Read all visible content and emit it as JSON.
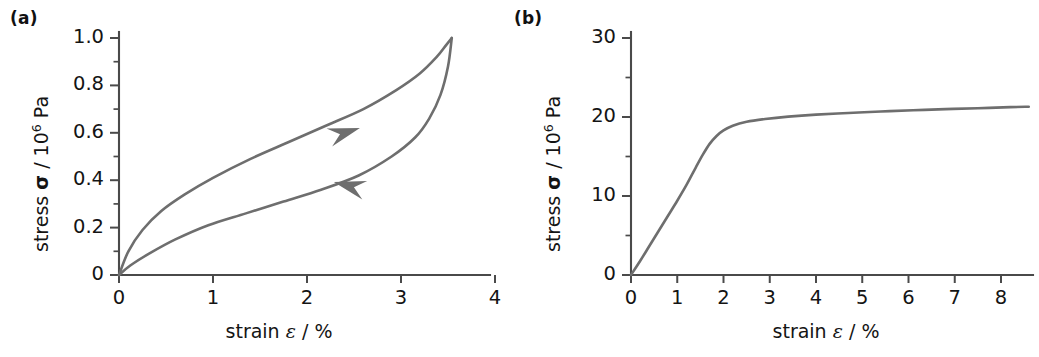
{
  "figure": {
    "background": "#ffffff",
    "curve_color": "#6e6e6e",
    "axis_color": "#4a4a4a",
    "text_color": "#141414"
  },
  "panels": [
    {
      "id": "a",
      "label": "(a)",
      "axis_title_x_pre": "strain ",
      "axis_title_x_sym": "ε",
      "axis_title_x_post": " / %",
      "axis_title_y_pre": "stress ",
      "axis_title_y_sym": "σ",
      "axis_title_y_mid": " / 10",
      "axis_title_y_exp": "6",
      "axis_title_y_post": " Pa",
      "x_ticklabels": [
        "0",
        "1",
        "2",
        "3",
        "4"
      ],
      "y_ticklabels": [
        "0",
        "0.2",
        "0.4",
        "0.6",
        "0.8",
        "1.0"
      ]
    },
    {
      "id": "b",
      "label": "(b)",
      "axis_title_x_pre": "strain ",
      "axis_title_x_sym": "ε",
      "axis_title_x_post": " / %",
      "axis_title_y_pre": "stress ",
      "axis_title_y_sym": "σ",
      "axis_title_y_mid": " / 10",
      "axis_title_y_exp": "6",
      "axis_title_y_post": " Pa",
      "x_ticklabels": [
        "0",
        "1",
        "2",
        "3",
        "4",
        "5",
        "6",
        "7",
        "8"
      ],
      "y_ticklabels": [
        "0",
        "10",
        "20",
        "30"
      ]
    }
  ],
  "chart_data": [
    {
      "type": "line",
      "panel": "a",
      "title": "(a)",
      "xlabel": "strain ε / %",
      "ylabel": "stress σ / 10^6 Pa",
      "xlim": [
        0,
        4.3
      ],
      "ylim": [
        0,
        1.05
      ],
      "xticks": [
        0,
        1,
        2,
        3,
        4
      ],
      "yticks": [
        0,
        0.2,
        0.4,
        0.6,
        0.8,
        1.0
      ],
      "xminor_step": 0.5,
      "yminor_step": 0.1,
      "grid": false,
      "legend": null,
      "annotations": [
        {
          "kind": "arrowhead",
          "series": "loading",
          "x": 2.4,
          "y": 0.6,
          "direction": "right"
        },
        {
          "kind": "arrowhead",
          "series": "unloading",
          "x": 2.45,
          "y": 0.375,
          "direction": "left"
        }
      ],
      "series": [
        {
          "name": "loading",
          "x": [
            0.0,
            0.1,
            0.25,
            0.45,
            0.7,
            1.0,
            1.4,
            1.8,
            2.2,
            2.6,
            2.95,
            3.2,
            3.38,
            3.48,
            3.54
          ],
          "y": [
            0.0,
            0.1,
            0.19,
            0.27,
            0.34,
            0.41,
            0.49,
            0.56,
            0.63,
            0.7,
            0.78,
            0.85,
            0.92,
            0.97,
            1.0
          ]
        },
        {
          "name": "unloading",
          "x": [
            3.54,
            3.5,
            3.42,
            3.3,
            3.15,
            2.9,
            2.55,
            2.15,
            1.75,
            1.35,
            0.95,
            0.6,
            0.32,
            0.12,
            0.0
          ],
          "y": [
            1.0,
            0.88,
            0.76,
            0.66,
            0.58,
            0.5,
            0.42,
            0.36,
            0.31,
            0.26,
            0.21,
            0.15,
            0.09,
            0.04,
            0.0
          ]
        }
      ]
    },
    {
      "type": "line",
      "panel": "b",
      "title": "(b)",
      "xlabel": "strain ε / %",
      "ylabel": "stress σ / 10^6 Pa",
      "xlim": [
        0,
        8.6
      ],
      "ylim": [
        0,
        31.5
      ],
      "xticks": [
        0,
        1,
        2,
        3,
        4,
        5,
        6,
        7,
        8
      ],
      "yticks": [
        0,
        10,
        20,
        30
      ],
      "xminor_step": 0.5,
      "yminor_step": 5,
      "grid": false,
      "legend": null,
      "annotations": [],
      "series": [
        {
          "name": "stress-strain",
          "x": [
            0.0,
            0.2,
            0.4,
            0.6,
            0.8,
            1.0,
            1.2,
            1.4,
            1.55,
            1.7,
            1.85,
            2.0,
            2.2,
            2.5,
            2.9,
            3.4,
            4.0,
            4.7,
            5.4,
            6.1,
            6.8,
            7.5,
            8.2,
            8.6
          ],
          "y": [
            0.0,
            1.8,
            3.7,
            5.6,
            7.5,
            9.4,
            11.4,
            13.6,
            15.2,
            16.6,
            17.6,
            18.3,
            18.9,
            19.4,
            19.75,
            20.05,
            20.3,
            20.5,
            20.7,
            20.85,
            21.0,
            21.1,
            21.25,
            21.3
          ]
        }
      ]
    }
  ]
}
